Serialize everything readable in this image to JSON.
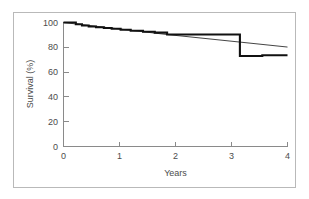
{
  "figure": {
    "background_color": "#ffffff",
    "frame_color": "#b9b9b9",
    "axis_color": "#8a8a8a",
    "text_color": "#4c4c4c"
  },
  "chart_data": {
    "type": "line",
    "title": "",
    "subtitle": "",
    "xlabel": "Years",
    "ylabel": "Survival (%)",
    "xlim": [
      0,
      4
    ],
    "ylim": [
      0,
      100
    ],
    "xticks": [
      0,
      1,
      2,
      3,
      4
    ],
    "xtick_labels": [
      "0",
      "1",
      "2",
      "3",
      "4"
    ],
    "yticks": [
      0,
      20,
      40,
      60,
      80,
      100
    ],
    "ytick_labels": [
      "0",
      "20",
      "40",
      "60",
      "80",
      "100"
    ],
    "grid": false,
    "legend": "none",
    "annotations": [],
    "series": [
      {
        "name": "Kaplan-Meier survival (stepped)",
        "style": "step",
        "line_width": 2.1,
        "color": "#111111",
        "x": [
          0.0,
          0.22,
          0.22,
          0.33,
          0.33,
          0.45,
          0.45,
          0.58,
          0.58,
          0.72,
          0.72,
          0.86,
          0.86,
          1.02,
          1.02,
          1.2,
          1.2,
          1.42,
          1.42,
          1.63,
          1.63,
          1.85,
          1.85,
          3.15,
          3.15,
          3.55,
          3.55,
          4.0
        ],
        "y": [
          100.0,
          100.0,
          98.6,
          98.6,
          97.6,
          97.6,
          96.8,
          96.8,
          96.2,
          96.2,
          95.6,
          95.6,
          95.0,
          95.0,
          94.2,
          94.2,
          93.4,
          93.4,
          92.6,
          92.6,
          91.8,
          91.8,
          90.3,
          90.3,
          73.0,
          73.0,
          73.6,
          73.6
        ]
      },
      {
        "name": "Expected / reference survival (thin)",
        "style": "line",
        "line_width": 0.85,
        "color": "#222222",
        "x": [
          0.0,
          1.85,
          3.15,
          4.0
        ],
        "y": [
          100.0,
          90.3,
          84.2,
          80.2
        ]
      }
    ]
  }
}
